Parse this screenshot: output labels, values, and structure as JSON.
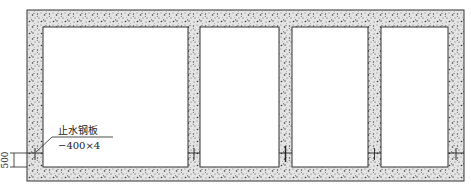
{
  "diagram": {
    "type": "structural-section",
    "cells": 4,
    "colors": {
      "background": "#ffffff",
      "concrete_fill": "#d8d8d8",
      "concrete_speckle": "#555555",
      "line": "#333333"
    }
  },
  "annotation": {
    "label_line1": "止水钢板",
    "label_line2": "−400×4"
  },
  "dimension": {
    "value": "500"
  }
}
